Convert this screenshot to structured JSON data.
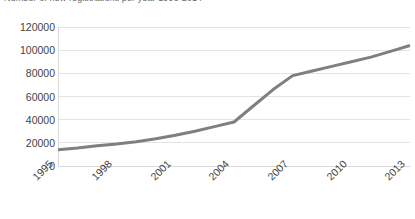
{
  "title_clipped": "Number of new registrations per year 1996-2014",
  "chart_data": {
    "type": "line",
    "title": "",
    "xlabel": "",
    "ylabel": "",
    "ylim": [
      0,
      120000
    ],
    "xlim": [
      1996,
      2014
    ],
    "grid": true,
    "legend": false,
    "legend_position": "none",
    "line_color": "#7F7F7F",
    "gridline_color": "#E4E4E4",
    "axis_color": "#D9D9D9",
    "y_ticks": [
      0,
      20000,
      40000,
      60000,
      80000,
      100000,
      120000
    ],
    "y_tick_labels": [
      "0",
      "20000",
      "40000",
      "60000",
      "80000",
      "100000",
      "120000"
    ],
    "x_tick_labels": [
      "1995",
      "1998",
      "2001",
      "2004",
      "2007",
      "2010",
      "2013"
    ],
    "x": [
      1996,
      1997,
      1998,
      1999,
      2000,
      2001,
      2002,
      2003,
      2004,
      2005,
      2006,
      2007,
      2008,
      2009,
      2010,
      2011,
      2012,
      2013,
      2014
    ],
    "values": [
      14000,
      15500,
      17500,
      19000,
      21000,
      23500,
      26500,
      30000,
      34000,
      38000,
      52000,
      66000,
      78000,
      82000,
      86000,
      90000,
      94000,
      99000,
      104000
    ],
    "series": [
      {
        "name": "registrations",
        "values": [
          14000,
          15500,
          17500,
          19000,
          21000,
          23500,
          26500,
          30000,
          34000,
          38000,
          52000,
          66000,
          78000,
          82000,
          86000,
          90000,
          94000,
          99000,
          104000
        ]
      }
    ]
  }
}
